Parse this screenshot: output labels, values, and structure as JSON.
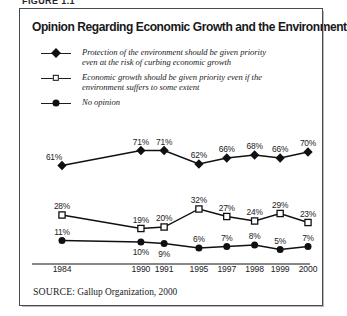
{
  "figure_caption": "FIGURE 1.1",
  "chart_title": "Opinion Regarding Economic Growth and the Environment",
  "legend": {
    "items": [
      {
        "marker": "filled-diamond-marker",
        "line1": "Protection of the environment should be given priority",
        "line2": "even at the risk of curbing economic growth"
      },
      {
        "marker": "open-square-marker",
        "line1": "Economic growth should be given priority even if the",
        "line2": "environment suffers to some extent"
      },
      {
        "marker": "filled-circle-marker",
        "line1": "No opinion",
        "line2": ""
      }
    ]
  },
  "source": {
    "label": "SOURCE",
    "text": ": Gallup Organization, 2000"
  },
  "colors": {
    "line": "#101013",
    "text": "#1b1b1e",
    "frame": "#4a4a4f",
    "background": "#ffffff"
  },
  "chart_data": {
    "type": "line",
    "title": "Opinion Regarding Economic Growth and the Environment",
    "xlabel": "",
    "ylabel": "",
    "ylim": [
      0,
      80
    ],
    "grid": false,
    "legend_position": "top",
    "categories": [
      "1984",
      "1990",
      "1991",
      "1995",
      "1997",
      "1998",
      "1999",
      "2000"
    ],
    "x_positions": [
      0,
      34,
      44,
      59,
      71,
      83,
      94,
      106
    ],
    "series": [
      {
        "name": "Protection of the environment should be given priority even at the risk of curbing economic growth",
        "marker": "filled-diamond",
        "values": [
          61,
          71,
          71,
          62,
          66,
          68,
          66,
          70
        ],
        "labels": [
          "61%",
          "71%",
          "71%",
          "62%",
          "66%",
          "68%",
          "66%",
          "70%"
        ],
        "label_positions": [
          "left",
          "above",
          "above",
          "above",
          "above",
          "above",
          "above",
          "above"
        ]
      },
      {
        "name": "Economic growth should be given priority even if the environment suffers to some extent",
        "marker": "open-square",
        "values": [
          28,
          19,
          20,
          32,
          27,
          24,
          29,
          23
        ],
        "labels": [
          "28%",
          "19%",
          "20%",
          "32%",
          "27%",
          "24%",
          "29%",
          "23%"
        ],
        "label_positions": [
          "above",
          "above",
          "above",
          "above",
          "above",
          "above",
          "above",
          "above"
        ]
      },
      {
        "name": "No opinion",
        "marker": "filled-circle",
        "values": [
          11,
          10,
          9,
          6,
          7,
          8,
          5,
          7
        ],
        "labels": [
          "11%",
          "10%",
          "9%",
          "6%",
          "7%",
          "8%",
          "5%",
          "7%"
        ],
        "label_positions": [
          "above",
          "below",
          "below",
          "above",
          "above",
          "above",
          "above",
          "above"
        ]
      }
    ]
  }
}
